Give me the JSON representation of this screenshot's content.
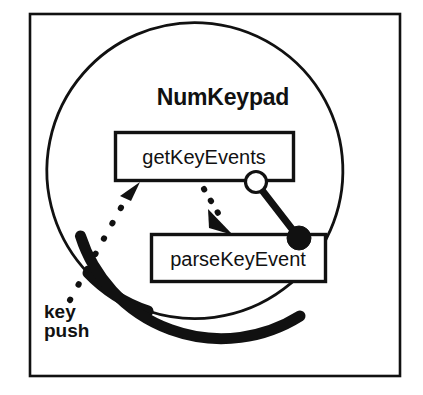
{
  "diagram": {
    "kind": "uml-component-diagram",
    "component": {
      "name": "NumKeypad"
    },
    "boxes": [
      {
        "id": "get-key-events",
        "label": "getKeyEvents",
        "x": 114,
        "y": 131,
        "width": 181,
        "height": 51
      },
      {
        "id": "parse-key-event",
        "label": "parseKeyEvent",
        "x": 150,
        "y": 233,
        "width": 177,
        "height": 50
      }
    ],
    "interface_connector": {
      "socket_label": "provided-interface-socket",
      "ball_label": "required-interface-ball",
      "socket": {
        "cx": 256,
        "cy": 182,
        "r": 10.5
      },
      "ball": {
        "cx": 299,
        "cy": 238,
        "r": 12
      },
      "line_width": 7
    },
    "callout": {
      "line1": "key",
      "line2": "push"
    },
    "dotted_arrows": [
      {
        "id": "key-push-to-get-key-events",
        "label": "key-push-dependency"
      },
      {
        "id": "get-key-events-to-parse-key-event",
        "label": "internal-call-dependency"
      }
    ],
    "colors": {
      "stroke": "#111111",
      "background": "#ffffff",
      "fill_white": "#ffffff",
      "fill_black": "#111111"
    }
  }
}
